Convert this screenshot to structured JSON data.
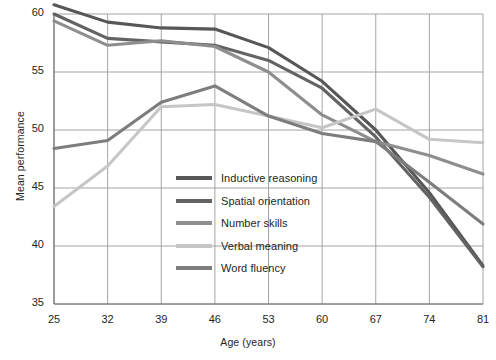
{
  "chart_data": {
    "type": "line",
    "title": "",
    "xlabel": "Age (years)",
    "ylabel": "Mean performance",
    "x": [
      25,
      32,
      39,
      46,
      53,
      60,
      67,
      74,
      81
    ],
    "xticklabels": [
      "25",
      "32",
      "39",
      "46",
      "53",
      "60",
      "67",
      "74",
      "81"
    ],
    "yticklabels": [
      "35",
      "40",
      "45",
      "50",
      "55",
      "60"
    ],
    "xlim": [
      25,
      81
    ],
    "ylim": [
      35,
      60
    ],
    "ytick_step": 5,
    "grid": true,
    "legend_position": "center-left-inside",
    "series": [
      {
        "name": "Inductive reasoning",
        "color": "#575757",
        "values": [
          60.8,
          59.3,
          58.8,
          58.7,
          57.1,
          54.2,
          50.0,
          44.6,
          38.3
        ]
      },
      {
        "name": "Spatial orientation",
        "color": "#636363",
        "values": [
          60.0,
          57.9,
          57.6,
          57.3,
          56.0,
          53.6,
          49.4,
          44.2,
          38.2
        ]
      },
      {
        "name": "Number skills",
        "color": "#8e8e8e",
        "values": [
          59.4,
          57.3,
          57.7,
          57.2,
          55.0,
          51.3,
          49.0,
          47.8,
          46.2
        ]
      },
      {
        "name": "Verbal meaning",
        "color": "#c6c6c6",
        "values": [
          43.4,
          46.9,
          52.0,
          52.2,
          51.2,
          50.2,
          51.8,
          49.2,
          48.9
        ]
      },
      {
        "name": "Word fluency",
        "color": "#7d7d7d",
        "values": [
          48.4,
          49.1,
          52.4,
          53.8,
          51.2,
          49.7,
          49.0,
          45.5,
          41.9
        ]
      }
    ]
  },
  "axes": {
    "grid_color": "#9a9a9a",
    "axis_color": "#6f6f6f"
  }
}
